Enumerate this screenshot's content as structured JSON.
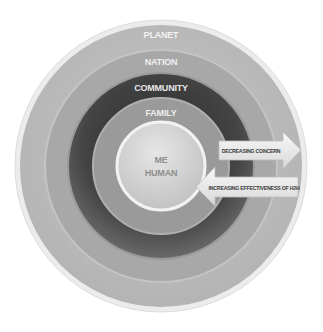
{
  "diagram": {
    "rings": [
      {
        "label": "PLANET",
        "color": "#b9b9b9",
        "text_color": "#f2f2f2"
      },
      {
        "label": "NATION",
        "color": "#a9a9a9",
        "text_color": "#f0f0f0"
      },
      {
        "label": "COMMUNITY",
        "color": "#3a3a3a",
        "text_color": "#e6e6e6"
      },
      {
        "label": "FAMILY",
        "color": "#9c9c9c",
        "text_color": "#eeeeee"
      }
    ],
    "center": {
      "line1": "ME",
      "line2": "HUMAN",
      "color": "#d4d4d4",
      "text_color": "#8e8e8e"
    },
    "arrows": [
      {
        "label": "DECREASING CONCERN",
        "direction": "right"
      },
      {
        "label": "INCREASING EFFECTIVENESS OF H2H",
        "direction": "left"
      }
    ]
  }
}
